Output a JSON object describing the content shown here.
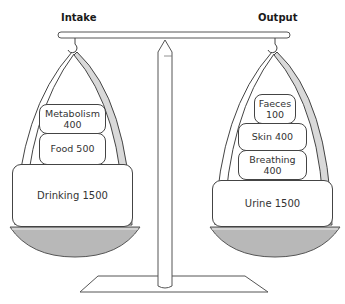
{
  "diagram": {
    "title_left": "Intake",
    "title_right": "Output",
    "intake": [
      {
        "label": "Metabolism\n400",
        "line1": "Metabolism",
        "line2": "400"
      },
      {
        "label": "Food 500"
      },
      {
        "label": "Drinking 1500"
      }
    ],
    "output": [
      {
        "label": "Faeces\n100",
        "line1": "Faeces",
        "line2": "100"
      },
      {
        "label": "Skin 400"
      },
      {
        "label": "Breathing\n400",
        "line1": "Breathing",
        "line2": "400"
      },
      {
        "label": "Urine 1500"
      }
    ],
    "colors": {
      "line": "#444444",
      "pan_fill": "#b8b8b8",
      "strap_fill": "#d9d9d9"
    }
  }
}
